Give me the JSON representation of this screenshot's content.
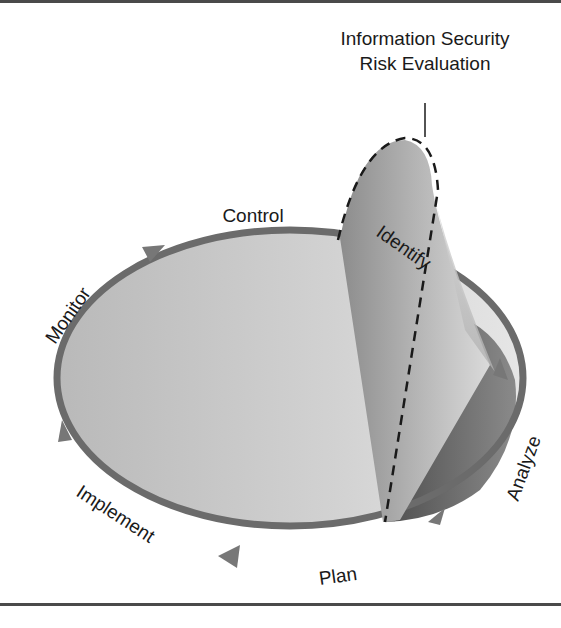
{
  "diagram": {
    "title_line1": "Information Security",
    "title_line2": "Risk Evaluation",
    "cycle_labels": {
      "control": "Control",
      "monitor": "Monitor",
      "implement": "Implement",
      "plan": "Plan",
      "analyze": "Analyze",
      "identify": "Identify"
    },
    "colors": {
      "ring": "#6b6b6b",
      "fill_light": "#d4d4d4",
      "fill_mid": "#a8a8a8",
      "fill_dark": "#6e6e6e",
      "text": "#1a1a1a",
      "rule": "#4a4a4a"
    }
  }
}
